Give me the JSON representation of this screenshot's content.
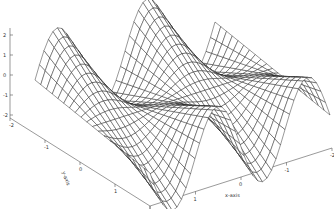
{
  "chart_data": {
    "type": "surface",
    "title": "",
    "function": "z = y * sin(pi * x)",
    "x": {
      "label": "x-axis",
      "range": [
        -2,
        2
      ],
      "ticks": [
        "2",
        "1",
        "0",
        "-1",
        "-2"
      ]
    },
    "y": {
      "label": "y-axis",
      "range": [
        -2,
        2
      ],
      "ticks": [
        "-2",
        "-1",
        "0",
        "1",
        "2"
      ]
    },
    "z": {
      "label": "",
      "range": [
        -2,
        2
      ],
      "ticks": [
        "2",
        "1",
        "0",
        "-1",
        "-2"
      ]
    },
    "grid": {
      "nx": 41,
      "ny": 21
    },
    "style": {
      "line_color": "#1a1a1a",
      "face_color": "#ffffff",
      "background": "#ffffff"
    },
    "grid_on": false,
    "legend": null
  }
}
